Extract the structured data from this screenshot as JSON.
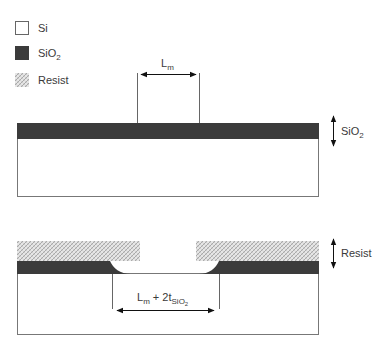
{
  "legend": {
    "items": [
      {
        "name": "Si",
        "label_main": "Si",
        "label_sub": "",
        "fill": "#ffffff"
      },
      {
        "name": "SiO2",
        "label_main": "SiO",
        "label_sub": "2",
        "fill": "#3b3b3b"
      },
      {
        "name": "Resist",
        "label_main": "Resist",
        "label_sub": "",
        "fill": "hatched"
      }
    ]
  },
  "top_structure": {
    "dimension_label_main": "L",
    "dimension_label_sub": "m",
    "thickness_label_main": "SiO",
    "thickness_label_sub": "2"
  },
  "bottom_structure": {
    "dimension_label_main": "L",
    "dimension_label_sub": "m",
    "dimension_label_plus": " + 2t",
    "dimension_label_sub2": "SiO",
    "dimension_label_sub2_sub": "2",
    "thickness_label": "Resist"
  },
  "colors": {
    "oxide": "#3b3b3b",
    "substrate": "#ffffff",
    "outline": "#777777",
    "resist_light": "#e4e4e4",
    "resist_dark": "#a9a9a9"
  }
}
